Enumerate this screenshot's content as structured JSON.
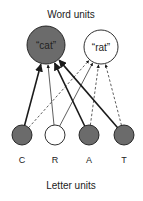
{
  "title_top": "Word units",
  "title_bottom": "Letter units",
  "word_units": [
    {
      "id": "cat",
      "label": "“cat”",
      "active": true,
      "cx": 46,
      "cy": 45,
      "r": 19
    },
    {
      "id": "rat",
      "label": "“rat”",
      "active": false,
      "cx": 101,
      "cy": 47,
      "r": 17
    }
  ],
  "letter_units": [
    {
      "id": "C",
      "label": "C",
      "active": true,
      "cx": 22,
      "cy": 135,
      "r": 10
    },
    {
      "id": "R",
      "label": "R",
      "active": false,
      "cx": 55,
      "cy": 135,
      "r": 10
    },
    {
      "id": "A",
      "label": "A",
      "active": true,
      "cx": 89,
      "cy": 135,
      "r": 10
    },
    {
      "id": "T",
      "label": "T",
      "active": true,
      "cx": 124,
      "cy": 135,
      "r": 10
    }
  ],
  "connections": [
    {
      "from": "C",
      "to": "cat",
      "style": "thick-solid"
    },
    {
      "from": "C",
      "to": "rat",
      "style": "dashed"
    },
    {
      "from": "R",
      "to": "cat",
      "style": "thin-solid"
    },
    {
      "from": "R",
      "to": "rat",
      "style": "thin-solid"
    },
    {
      "from": "A",
      "to": "cat",
      "style": "thick-solid"
    },
    {
      "from": "A",
      "to": "rat",
      "style": "dashed"
    },
    {
      "from": "T",
      "to": "cat",
      "style": "thick-solid"
    },
    {
      "from": "T",
      "to": "rat",
      "style": "dashed"
    }
  ],
  "colors": {
    "active_fill": "#6b6b6b",
    "inactive_fill": "#ffffff",
    "stroke": "#1a1a1a"
  }
}
